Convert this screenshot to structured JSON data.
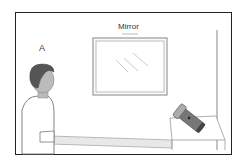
{
  "labels": {
    "mirror": "Mirror",
    "person": "A"
  },
  "colors": {
    "frame": "#222222",
    "mirror_frame": "#999999",
    "hair": "#555555",
    "skin": "#bbbbbb",
    "shirt": "#ffffff",
    "flashlight": "#666666"
  }
}
